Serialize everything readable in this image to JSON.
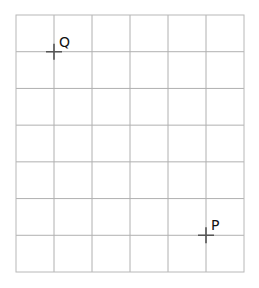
{
  "grid": {
    "columns": 6,
    "rows": 7,
    "left": 16,
    "top": 15,
    "right": 244,
    "bottom": 272,
    "line_color": "#b0b0b0",
    "border_color": "#b8b8b8"
  },
  "points": [
    {
      "label": "Q",
      "grid_col": 1,
      "grid_row": 1,
      "x": 54,
      "y": 51
    },
    {
      "label": "P",
      "grid_col": 5,
      "grid_row": 6,
      "x": 206,
      "y": 236
    }
  ],
  "marker_color": "#555555"
}
